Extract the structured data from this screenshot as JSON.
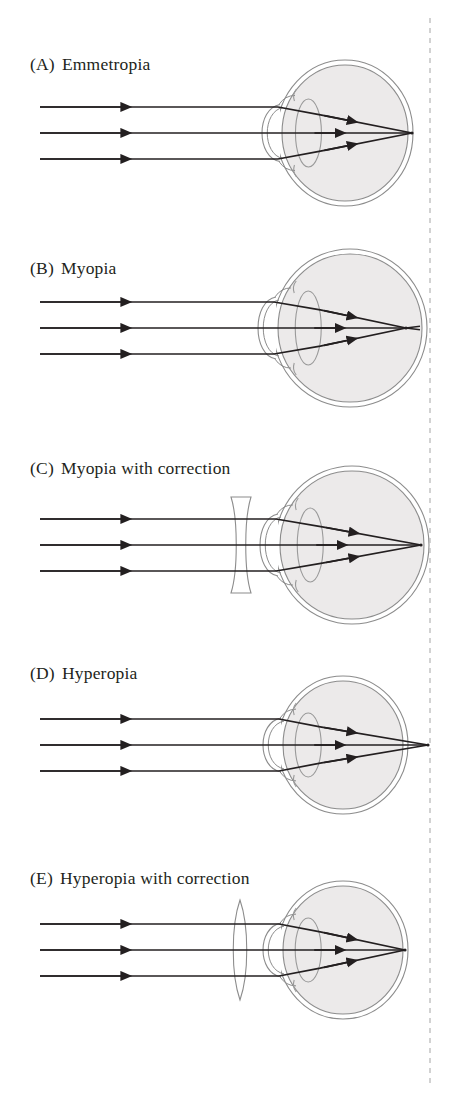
{
  "figure": {
    "background_color": "#ffffff",
    "width": 461,
    "height": 1100
  },
  "style": {
    "ray_color": "#231f20",
    "eye_outline_color": "#8c8c8c",
    "eye_fill_color": "#eceaea",
    "cornea_outline_color": "#8c8c8c",
    "lens_outline_color": "#9a9a9a",
    "correcting_lens_color": "#8c8c8c",
    "reference_line_color": "#b5b5b5",
    "label_color": "#231f20"
  },
  "reference_line": {
    "name": "focal-reference-line",
    "x": 430,
    "dash": "5 5",
    "description": "vertical dashed reference plane marking the normal focal distance"
  },
  "panels": [
    {
      "id": "A",
      "tag": "(A)",
      "label": "Emmetropia",
      "label_x": 30,
      "label_y": 54,
      "condition": "normal",
      "eye": {
        "center_x": 345,
        "center_y": 133,
        "radius_x": 63,
        "radius_y": 68
      },
      "focal_point_x": 412,
      "focus_note": "rays converge precisely on the retina",
      "correcting_lens": null,
      "rays_y": [
        107,
        133,
        159
      ]
    },
    {
      "id": "B",
      "tag": "(B)",
      "label": "Myopia",
      "label_x": 30,
      "label_y": 258,
      "condition": "nearsighted",
      "eye": {
        "center_x": 350,
        "center_y": 328,
        "radius_x": 72,
        "radius_y": 74
      },
      "focal_point_x": 406,
      "focus_note": "elongated eye: rays converge in front of the retina and cross",
      "correcting_lens": null,
      "rays_y": [
        302,
        328,
        354
      ]
    },
    {
      "id": "C",
      "tag": "(C)",
      "label": "Myopia with correction",
      "label_x": 30,
      "label_y": 458,
      "condition": "nearsighted-corrected",
      "eye": {
        "center_x": 352,
        "center_y": 545,
        "radius_x": 72,
        "radius_y": 74
      },
      "focal_point_x": 421,
      "focus_note": "concave lens diverges rays so focus falls on the retina",
      "correcting_lens": {
        "type": "concave",
        "name": "concave-correcting-lens",
        "center_x": 241,
        "center_y": 545,
        "half_height": 48,
        "half_width": 10
      },
      "rays_y": [
        519,
        545,
        571
      ]
    },
    {
      "id": "D",
      "tag": "(D)",
      "label": "Hyperopia",
      "label_x": 30,
      "label_y": 663,
      "condition": "farsighted",
      "eye": {
        "center_x": 343,
        "center_y": 745,
        "radius_x": 60,
        "radius_y": 64
      },
      "focal_point_x": 428,
      "focus_note": "shortened eye: rays would focus behind the retina",
      "correcting_lens": null,
      "rays_y": [
        719,
        745,
        771
      ]
    },
    {
      "id": "E",
      "tag": "(E)",
      "label": "Hyperopia with correction",
      "label_x": 30,
      "label_y": 868,
      "condition": "farsighted-corrected",
      "eye": {
        "center_x": 343,
        "center_y": 950,
        "radius_x": 60,
        "radius_y": 64
      },
      "focal_point_x": 405,
      "focus_note": "convex lens converges rays so focus falls on the retina",
      "correcting_lens": {
        "type": "convex",
        "name": "convex-correcting-lens",
        "center_x": 240,
        "center_y": 950,
        "half_height": 50,
        "half_width": 9
      },
      "rays_y": [
        924,
        950,
        976
      ]
    }
  ],
  "rays": {
    "start_x": 40,
    "count": 3,
    "arrow_marker": "solid-triangle",
    "arrow_position_x": 128
  }
}
